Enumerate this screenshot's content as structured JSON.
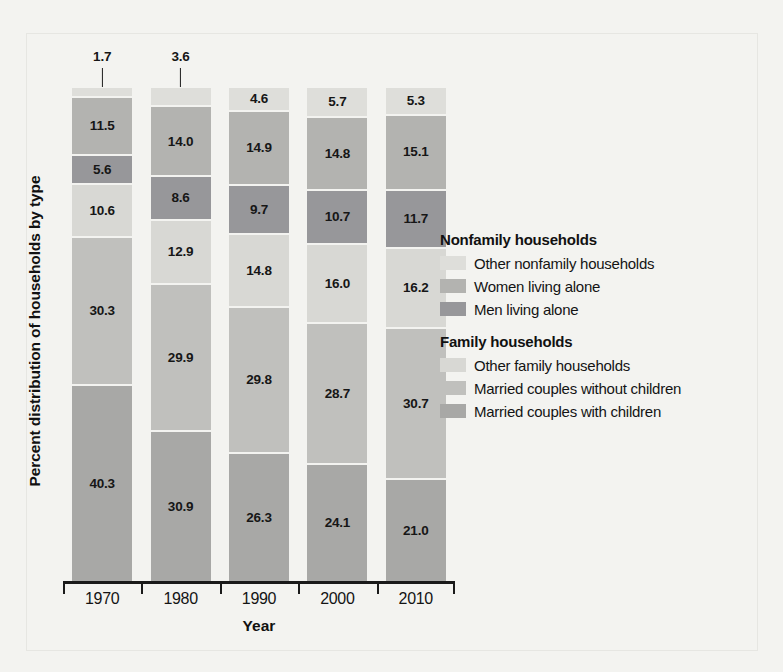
{
  "chart_data": {
    "type": "bar",
    "subtype": "stacked-100-percent",
    "title": "",
    "xlabel": "Year",
    "ylabel": "Percent distribution of households by type",
    "categories": [
      "1970",
      "1980",
      "1990",
      "2000",
      "2010"
    ],
    "ylim": [
      0,
      100
    ],
    "grid": false,
    "legend_position": "right",
    "stack_order_top_to_bottom": [
      "Other nonfamily households",
      "Women living alone",
      "Men living alone",
      "Other family households",
      "Married couples without children",
      "Married couples with children"
    ],
    "series": [
      {
        "name": "Other nonfamily households",
        "group": "Nonfamily households",
        "color": "#dededa",
        "values": [
          1.7,
          3.6,
          4.6,
          5.7,
          5.3
        ]
      },
      {
        "name": "Women living alone",
        "group": "Nonfamily households",
        "color": "#b3b3b0",
        "values": [
          11.5,
          14.0,
          14.9,
          14.8,
          15.1
        ]
      },
      {
        "name": "Men living alone",
        "group": "Nonfamily households",
        "color": "#97979a",
        "values": [
          5.6,
          8.6,
          9.7,
          10.7,
          11.7
        ]
      },
      {
        "name": "Other family households",
        "group": "Family households",
        "color": "#d8d8d4",
        "values": [
          10.6,
          12.9,
          14.8,
          16.0,
          16.2
        ]
      },
      {
        "name": "Married couples without children",
        "group": "Family households",
        "color": "#c0c0bd",
        "values": [
          30.3,
          29.9,
          29.8,
          28.7,
          30.7
        ]
      },
      {
        "name": "Married couples with children",
        "group": "Family households",
        "color": "#a8a8a6",
        "values": [
          40.3,
          30.9,
          26.3,
          24.1,
          21.0
        ]
      }
    ],
    "callout_labels": [
      {
        "category": "1970",
        "series": "Other nonfamily households",
        "value": "1.7"
      },
      {
        "category": "1980",
        "series": "Other nonfamily households",
        "value": "3.6"
      }
    ],
    "bar_labels": {
      "1970": [
        "1.7",
        "11.5",
        "5.6",
        "10.6",
        "30.3",
        "40.3"
      ],
      "1980": [
        "3.6",
        "14.0",
        "8.6",
        "12.9",
        "29.9",
        "30.9"
      ],
      "1990": [
        "4.6",
        "14.9",
        "9.7",
        "14.8",
        "29.8",
        "26.3"
      ],
      "2000": [
        "5.7",
        "14.8",
        "10.7",
        "16.0",
        "28.7",
        "24.1"
      ],
      "2010": [
        "5.3",
        "15.1",
        "11.7",
        "16.2",
        "30.7",
        "21.0"
      ]
    }
  },
  "axis": {
    "x_title": "Year",
    "y_title": "Percent distribution of households by type",
    "x_ticks": [
      "1970",
      "1980",
      "1990",
      "2000",
      "2010"
    ]
  },
  "legend": {
    "groups": [
      {
        "title": "Nonfamily households",
        "items": [
          {
            "label": "Other nonfamily households",
            "color": "#dededa"
          },
          {
            "label": "Women living alone",
            "color": "#b3b3b0"
          },
          {
            "label": "Men living alone",
            "color": "#97979a"
          }
        ]
      },
      {
        "title": "Family households",
        "items": [
          {
            "label": "Other family households",
            "color": "#d8d8d4"
          },
          {
            "label": "Married couples without children",
            "color": "#c0c0bd"
          },
          {
            "label": "Married couples with children",
            "color": "#a8a8a6"
          }
        ]
      }
    ]
  }
}
